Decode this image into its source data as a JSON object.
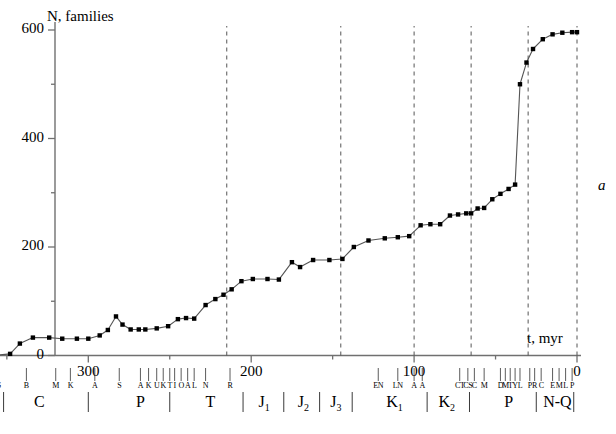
{
  "figure": {
    "panel_letter": "a",
    "y_axis_title": "N, families",
    "x_axis_title": "t, myr"
  },
  "chart_data": {
    "type": "line",
    "title": "N, families",
    "xlabel": "t, myr",
    "ylabel": "N, families",
    "xlim": [
      360,
      0
    ],
    "ylim": [
      0,
      620
    ],
    "x_ticks_major": [
      300,
      200,
      100,
      0
    ],
    "x_ticks_minor": [
      350,
      250,
      150,
      50
    ],
    "y_ticks_major": [
      0,
      200,
      400,
      600
    ],
    "y_ticks_minor": [
      100,
      300,
      500
    ],
    "x_axis_reversed": true,
    "grid": false,
    "legend": null,
    "marker": "filled-square",
    "series": [
      {
        "name": "Number of families",
        "points": [
          [
            358,
            0
          ],
          [
            348,
            3
          ],
          [
            342,
            22
          ],
          [
            334,
            33
          ],
          [
            324,
            33
          ],
          [
            316,
            31
          ],
          [
            307,
            31
          ],
          [
            300,
            31
          ],
          [
            293,
            37
          ],
          [
            288,
            47
          ],
          [
            283,
            72
          ],
          [
            279,
            57
          ],
          [
            274,
            48
          ],
          [
            269,
            48
          ],
          [
            265,
            48
          ],
          [
            258,
            50
          ],
          [
            251,
            54
          ],
          [
            245,
            67
          ],
          [
            240,
            69
          ],
          [
            235,
            68
          ],
          [
            228,
            93
          ],
          [
            222,
            104
          ],
          [
            217,
            112
          ],
          [
            212,
            122
          ],
          [
            206,
            137
          ],
          [
            199,
            141
          ],
          [
            190,
            141
          ],
          [
            183,
            140
          ],
          [
            175,
            172
          ],
          [
            170,
            163
          ],
          [
            162,
            176
          ],
          [
            152,
            176
          ],
          [
            144,
            178
          ],
          [
            137,
            200
          ],
          [
            128,
            212
          ],
          [
            118,
            216
          ],
          [
            110,
            218
          ],
          [
            103,
            220
          ],
          [
            96,
            240
          ],
          [
            90,
            242
          ],
          [
            84,
            242
          ],
          [
            78,
            258
          ],
          [
            73,
            260
          ],
          [
            68,
            262
          ],
          [
            65,
            262
          ],
          [
            61,
            271
          ],
          [
            57,
            272
          ],
          [
            52,
            288
          ],
          [
            47,
            298
          ],
          [
            42,
            307
          ],
          [
            38,
            315
          ],
          [
            35,
            500
          ],
          [
            31,
            540
          ],
          [
            27,
            565
          ],
          [
            21,
            583
          ],
          [
            15,
            592
          ],
          [
            9,
            595
          ],
          [
            3,
            596
          ],
          [
            0,
            596
          ]
        ]
      }
    ],
    "vertical_dashed_lines": [
      215,
      145,
      100,
      65,
      30,
      0
    ],
    "annotations": []
  },
  "timescale": {
    "stages": [
      {
        "code": "S",
        "t": 355
      },
      {
        "code": "B",
        "t": 338
      },
      {
        "code": "M",
        "t": 320
      },
      {
        "code": "K",
        "t": 311
      },
      {
        "code": "A",
        "t": 296
      },
      {
        "code": "S",
        "t": 281
      },
      {
        "code": "A",
        "t": 268
      },
      {
        "code": "K",
        "t": 263
      },
      {
        "code": "U",
        "t": 258
      },
      {
        "code": "K",
        "t": 254
      },
      {
        "code": "T",
        "t": 250
      },
      {
        "code": "I",
        "t": 247
      },
      {
        "code": "O",
        "t": 243
      },
      {
        "code": "A",
        "t": 239
      },
      {
        "code": "L",
        "t": 235
      },
      {
        "code": "N",
        "t": 228
      },
      {
        "code": "R",
        "t": 213
      },
      {
        "code": "EN",
        "t": 122
      },
      {
        "code": "LN",
        "t": 110
      },
      {
        "code": "A",
        "t": 100
      },
      {
        "code": "A",
        "t": 95
      },
      {
        "code": "CT",
        "t": 72
      },
      {
        "code": "CS",
        "t": 67
      },
      {
        "code": "C",
        "t": 63
      },
      {
        "code": "M",
        "t": 57
      },
      {
        "code": "D",
        "t": 47
      },
      {
        "code": "M",
        "t": 44
      },
      {
        "code": "T",
        "t": 41
      },
      {
        "code": "Y",
        "t": 38
      },
      {
        "code": "L",
        "t": 35
      },
      {
        "code": "P",
        "t": 29
      },
      {
        "code": "R",
        "t": 26
      },
      {
        "code": "C",
        "t": 22
      },
      {
        "code": "E",
        "t": 15
      },
      {
        "code": "M",
        "t": 11
      },
      {
        "code": "L",
        "t": 7
      },
      {
        "code": "P",
        "t": 3
      }
    ],
    "periods": [
      {
        "label": "C",
        "sub": "",
        "t": 330
      },
      {
        "label": "P",
        "sub": "",
        "t": 268
      },
      {
        "label": "T",
        "sub": "",
        "t": 225
      },
      {
        "label": "J",
        "sub": "1",
        "t": 192
      },
      {
        "label": "J",
        "sub": "2",
        "t": 168
      },
      {
        "label": "J",
        "sub": "3",
        "t": 148
      },
      {
        "label": "K",
        "sub": "1",
        "t": 112
      },
      {
        "label": "K",
        "sub": "2",
        "t": 80
      },
      {
        "label": "P",
        "sub": "",
        "t": 42
      },
      {
        "label": "N-Q",
        "sub": "",
        "t": 12
      }
    ],
    "period_dividers": [
      352,
      300,
      250,
      205,
      180,
      158,
      138,
      92,
      66,
      25,
      2
    ]
  }
}
